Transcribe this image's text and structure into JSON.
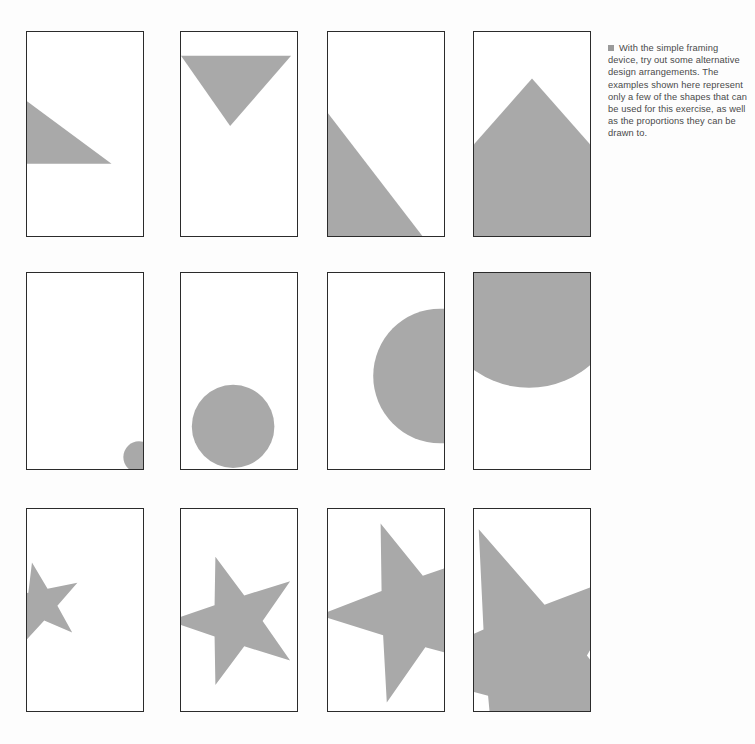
{
  "page": {
    "width": 755,
    "height": 744,
    "background_color": "#fdfdfd",
    "shape_fill_color": "#a9a9a9",
    "frame_border_color": "#2b2b2b"
  },
  "caption": {
    "bullet_icon": "filled-square-bullet",
    "text": "With the simple framing device, try out some alternative design arrangements. The examples shown here represent only a few of the shapes that can be used for this exercise, as well as the proportions they can be drawn to."
  },
  "grid": {
    "rows": 3,
    "columns": 4,
    "row_labels": [
      "triangles",
      "circles",
      "stars"
    ],
    "panels": [
      {
        "id": "panel-1",
        "row": 1,
        "column": 1,
        "shape": "triangle",
        "description": "small right triangle at mid-left, clipped by left edge",
        "x": 26,
        "y": 31,
        "w": 118,
        "h": 206,
        "polygon": "0,70 0,133 86,133",
        "circle": null
      },
      {
        "id": "panel-2",
        "row": 1,
        "column": 2,
        "shape": "triangle",
        "description": "downward-pointing triangle across the top, clipped by left edge",
        "x": 180,
        "y": 31,
        "w": 118,
        "h": 206,
        "polygon": "0,24 112,24 50,95",
        "circle": null
      },
      {
        "id": "panel-3",
        "row": 1,
        "column": 3,
        "shape": "triangle",
        "description": "large diagonal triangle filling the lower-left, clipped left and bottom",
        "x": 327,
        "y": 31,
        "w": 118,
        "h": 206,
        "polygon": "0,82 0,206 96,206",
        "circle": null
      },
      {
        "id": "panel-4",
        "row": 1,
        "column": 4,
        "shape": "triangle",
        "description": "peaked house form, triangle apex over a full-width block, clipped left right and bottom",
        "x": 473,
        "y": 31,
        "w": 118,
        "h": 206,
        "polygon": "-6,206 -6,120 59,47 124,120 124,206",
        "circle": null
      },
      {
        "id": "panel-5",
        "row": 2,
        "column": 1,
        "shape": "circle",
        "description": "small circle at the bottom-right corner, clipped by right and bottom edges",
        "x": 26,
        "y": 272,
        "w": 118,
        "h": 198,
        "polygon": null,
        "circle": {
          "cx": 114,
          "cy": 186,
          "r": 16
        }
      },
      {
        "id": "panel-6",
        "row": 2,
        "column": 2,
        "shape": "circle",
        "description": "medium circle in the lower centre, clipped by the bottom edge",
        "x": 180,
        "y": 272,
        "w": 118,
        "h": 198,
        "polygon": null,
        "circle": {
          "cx": 53,
          "cy": 155,
          "r": 42
        }
      },
      {
        "id": "panel-7",
        "row": 2,
        "column": 3,
        "shape": "circle",
        "description": "large circle on the right, clipped by the right edge",
        "x": 327,
        "y": 272,
        "w": 118,
        "h": 198,
        "polygon": null,
        "circle": {
          "cx": 114,
          "cy": 104,
          "r": 68
        }
      },
      {
        "id": "panel-8",
        "row": 2,
        "column": 4,
        "shape": "circle",
        "description": "very large circle filling the top, clipped by top left and right edges",
        "x": 473,
        "y": 272,
        "w": 118,
        "h": 198,
        "polygon": null,
        "circle": {
          "cx": 56,
          "cy": 20,
          "r": 96
        }
      },
      {
        "id": "panel-9",
        "row": 3,
        "column": 1,
        "shape": "star",
        "description": "small five-pointed star in the upper-left, clipped by the left edge",
        "x": 26,
        "y": 508,
        "w": 118,
        "h": 204,
        "polygon": null,
        "circle": null,
        "star": {
          "cx": 14,
          "cy": 96,
          "outer": 43,
          "inner": 17,
          "rotation": -12
        }
      },
      {
        "id": "panel-10",
        "row": 3,
        "column": 2,
        "shape": "star",
        "description": "medium five-pointed star roughly centred, touching the left edge",
        "x": 180,
        "y": 508,
        "w": 118,
        "h": 204,
        "polygon": null,
        "circle": null,
        "star": {
          "cx": 56,
          "cy": 113,
          "outer": 68,
          "inner": 27,
          "rotation": -18
        }
      },
      {
        "id": "panel-11",
        "row": 3,
        "column": 3,
        "shape": "star",
        "description": "large five-pointed star clipped by the right edge",
        "x": 327,
        "y": 508,
        "w": 118,
        "h": 204,
        "polygon": null,
        "circle": null,
        "star": {
          "cx": 86,
          "cy": 104,
          "outer": 95,
          "inner": 38,
          "rotation": -20
        }
      },
      {
        "id": "panel-12",
        "row": 3,
        "column": 4,
        "shape": "star",
        "description": "very large five-pointed star overflowing the frame on every side",
        "x": 473,
        "y": 508,
        "w": 118,
        "h": 204,
        "polygon": null,
        "circle": null,
        "star": {
          "cx": 58,
          "cy": 152,
          "outer": 142,
          "inner": 57,
          "rotation": -22
        }
      }
    ]
  }
}
